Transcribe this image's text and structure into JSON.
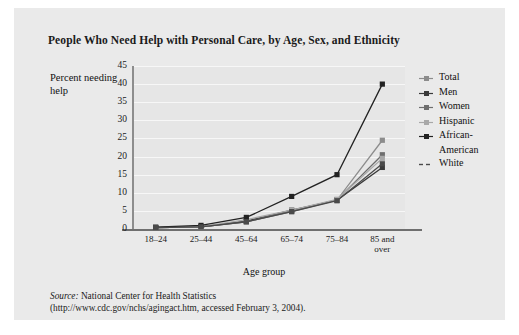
{
  "figure": {
    "title": "People Who Need Help with Personal Care, by Age, Sex, and Ethnicity",
    "source_label": "Source:",
    "source_text": " National Center for Health Statistics",
    "source_line2": "(http://www.cdc.gov/nchs/agingact.htm, accessed February 3, 2004)."
  },
  "axes": {
    "ylabel": "Percent needing help",
    "xlabel": "Age group",
    "yticks": [
      "45",
      "40",
      "35",
      "30",
      "25",
      "20",
      "15",
      "10",
      "5",
      "0"
    ],
    "xticks": [
      "18–24",
      "25–44",
      "45–64",
      "65–74",
      "75–84",
      "85 and over"
    ]
  },
  "legend": {
    "items": [
      {
        "label": "Total",
        "color": "#8c8c8c"
      },
      {
        "label": "Men",
        "color": "#3a3a3a"
      },
      {
        "label": "Women",
        "color": "#6e6e6e"
      },
      {
        "label": "Hispanic",
        "color": "#a8a8a8"
      },
      {
        "label": "African-",
        "label2": "American",
        "color": "#222222"
      },
      {
        "label": "White",
        "color": "#4a4a4a"
      }
    ]
  },
  "chart_data": {
    "type": "line",
    "title": "People Who Need Help with Personal Care, by Age, Sex, and Ethnicity",
    "xlabel": "Age group",
    "ylabel": "Percent needing help",
    "categories": [
      "18-24",
      "25-44",
      "45-64",
      "65-74",
      "75-84",
      "85 and over"
    ],
    "ylim": [
      0,
      45
    ],
    "ytick_step": 5,
    "grid": true,
    "legend_position": "right",
    "series": [
      {
        "name": "Total",
        "color": "#8c8c8c",
        "values": [
          0.4,
          0.6,
          2.0,
          5.0,
          8.0,
          24.5
        ]
      },
      {
        "name": "Men",
        "color": "#3a3a3a",
        "values": [
          0.4,
          0.6,
          2.2,
          5.2,
          8.0,
          17.0
        ]
      },
      {
        "name": "Women",
        "color": "#6e6e6e",
        "values": [
          0.4,
          0.6,
          2.0,
          4.8,
          8.0,
          20.5
        ]
      },
      {
        "name": "Hispanic",
        "color": "#a8a8a8",
        "values": [
          0.4,
          0.6,
          2.6,
          5.2,
          8.2,
          19.5
        ]
      },
      {
        "name": "African-American",
        "color": "#222222",
        "values": [
          0.5,
          1.0,
          3.2,
          9.0,
          15.0,
          40.0
        ]
      },
      {
        "name": "White",
        "color": "#4a4a4a",
        "values": [
          0.4,
          0.6,
          2.0,
          4.8,
          7.8,
          18.0
        ]
      }
    ]
  }
}
